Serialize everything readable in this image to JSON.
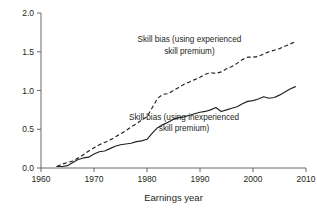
{
  "chart_data": {
    "type": "line",
    "title": "",
    "xlabel": "Earnings year",
    "ylabel": "",
    "xlim": [
      1960,
      2010
    ],
    "ylim": [
      0.0,
      2.0
    ],
    "grid": false,
    "legend": "inline-annotations",
    "xticks": [
      "1960",
      "1970",
      "1980",
      "1990",
      "2000",
      "2010"
    ],
    "xtick_values": [
      1960,
      1970,
      1980,
      1990,
      2000,
      2010
    ],
    "yticks": [
      "0.0",
      "0.5",
      "1.0",
      "1.5",
      "2.0"
    ],
    "ytick_values": [
      0.0,
      0.5,
      1.0,
      1.5,
      2.0
    ],
    "annotations": [
      {
        "name": "experienced-series-label",
        "line1": "Skill bias (using experienced",
        "line2": "skill premium)",
        "x": 1988,
        "y": 1.62
      },
      {
        "name": "inexperienced-series-label",
        "line1": "Skill bias (using inexperienced",
        "line2": "skill premium)",
        "x": 1987,
        "y": 0.62
      }
    ],
    "series": [
      {
        "name": "Skill bias (using experienced skill premium)",
        "style": "dashed",
        "color": "#231f20",
        "x": [
          1963,
          1964,
          1965,
          1966,
          1967,
          1968,
          1969,
          1970,
          1971,
          1972,
          1973,
          1974,
          1975,
          1976,
          1977,
          1978,
          1979,
          1980,
          1981,
          1982,
          1983,
          1984,
          1985,
          1986,
          1987,
          1988,
          1989,
          1990,
          1991,
          1992,
          1993,
          1994,
          1995,
          1996,
          1997,
          1998,
          1999,
          2000,
          2001,
          2002,
          2003,
          2004,
          2005,
          2006,
          2007,
          2008
        ],
        "values": [
          0.02,
          0.05,
          0.07,
          0.09,
          0.13,
          0.17,
          0.22,
          0.26,
          0.3,
          0.33,
          0.36,
          0.4,
          0.44,
          0.48,
          0.53,
          0.57,
          0.62,
          0.66,
          0.78,
          0.9,
          0.95,
          0.96,
          1.0,
          1.04,
          1.08,
          1.11,
          1.14,
          1.17,
          1.21,
          1.23,
          1.22,
          1.24,
          1.28,
          1.31,
          1.35,
          1.4,
          1.43,
          1.43,
          1.44,
          1.47,
          1.5,
          1.52,
          1.54,
          1.57,
          1.6,
          1.63
        ]
      },
      {
        "name": "Skill bias (using inexperienced skill premium)",
        "style": "solid",
        "color": "#231f20",
        "x": [
          1963,
          1964,
          1965,
          1966,
          1967,
          1968,
          1969,
          1970,
          1971,
          1972,
          1973,
          1974,
          1975,
          1976,
          1977,
          1978,
          1979,
          1980,
          1981,
          1982,
          1983,
          1984,
          1985,
          1986,
          1987,
          1988,
          1989,
          1990,
          1991,
          1992,
          1993,
          1994,
          1995,
          1996,
          1997,
          1998,
          1999,
          2000,
          2001,
          2002,
          2003,
          2004,
          2005,
          2006,
          2007,
          2008
        ],
        "values": [
          0.02,
          0.02,
          0.03,
          0.07,
          0.11,
          0.13,
          0.14,
          0.18,
          0.21,
          0.22,
          0.25,
          0.28,
          0.3,
          0.31,
          0.32,
          0.34,
          0.35,
          0.37,
          0.45,
          0.52,
          0.56,
          0.59,
          0.63,
          0.65,
          0.66,
          0.68,
          0.7,
          0.72,
          0.73,
          0.75,
          0.78,
          0.73,
          0.75,
          0.77,
          0.79,
          0.83,
          0.86,
          0.87,
          0.89,
          0.92,
          0.9,
          0.91,
          0.94,
          0.98,
          1.02,
          1.05
        ]
      }
    ]
  }
}
